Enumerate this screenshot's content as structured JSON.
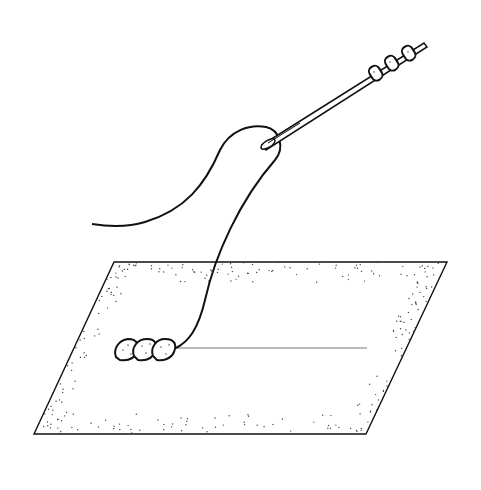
{
  "illustration": {
    "subject": "beading illustration: needle threaded with beads, thread leading to a row of beads on a fabric mat",
    "colors": {
      "ink": "#111111",
      "background": "#ffffff",
      "stipple": "#444444"
    },
    "needle": {
      "beads_on_needle": 3
    },
    "mat": {
      "beads_on_mat": 3
    }
  }
}
